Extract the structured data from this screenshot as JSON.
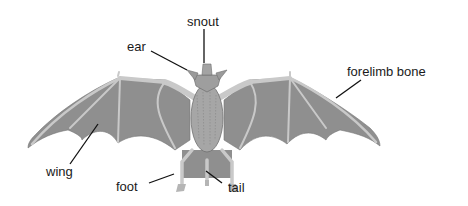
{
  "diagram": {
    "view": "dorsal, wings spread",
    "colors": {
      "membrane": "#8f8f8f",
      "bone": "#c9c9c9",
      "body": "#a6a6a6",
      "body_dark": "#7a7a7a",
      "label_text": "#1a1a1a",
      "leader_line": "#111111"
    },
    "labels": {
      "snout": "snout",
      "ear": "ear",
      "forelimb_bone": "forelimb bone",
      "wing": "wing",
      "foot": "foot",
      "tail": "tail"
    }
  }
}
